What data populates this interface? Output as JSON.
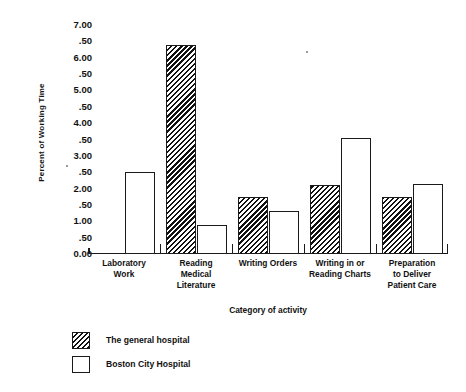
{
  "chart_data": {
    "type": "bar",
    "title": "",
    "xlabel": "Category of activity",
    "ylabel": "Percent of Working Time",
    "ylim": [
      0.0,
      7.0
    ],
    "grid": false,
    "legend_position": "below-left",
    "ytick_labels": [
      "7.00",
      ".50",
      "6.00",
      ".50",
      "5.00",
      ".50",
      "4.00",
      ".50",
      "3.00",
      ".50",
      "2.00",
      ".50",
      "1.00",
      ".50",
      "0.00"
    ],
    "ytick_values": [
      7.0,
      6.5,
      6.0,
      5.5,
      5.0,
      4.5,
      4.0,
      3.5,
      3.0,
      2.5,
      2.0,
      1.5,
      1.0,
      0.5,
      0.0
    ],
    "categories": [
      "Laboratory\nWork",
      "Reading\nMedical\nLiterature",
      "Writing Orders",
      "Writing in or\nReading Charts",
      "Preparation\nto Deliver\nPatient Care"
    ],
    "category_lines": [
      [
        "Laboratory",
        "Work"
      ],
      [
        "Reading",
        "Medical",
        "Literature"
      ],
      [
        "Writing Orders"
      ],
      [
        "Writing in or",
        "Reading Charts"
      ],
      [
        "Preparation",
        "to Deliver",
        "Patient Care"
      ]
    ],
    "series": [
      {
        "name": "The general hospital",
        "fill": "hatched",
        "values": [
          0.0,
          6.4,
          1.75,
          2.1,
          1.75
        ]
      },
      {
        "name": "Boston City Hospital",
        "fill": "open",
        "values": [
          2.5,
          0.9,
          1.3,
          3.55,
          2.15
        ]
      }
    ]
  },
  "axis": {
    "ylabel": "Percent of Working Time",
    "xlabel": "Category of activity"
  },
  "legend": {
    "items": [
      {
        "label": "The general hospital",
        "fill": "hatched"
      },
      {
        "label": "Boston City Hospital",
        "fill": "open"
      }
    ]
  },
  "colors": {
    "ink": "#111111",
    "background": "#ffffff"
  }
}
